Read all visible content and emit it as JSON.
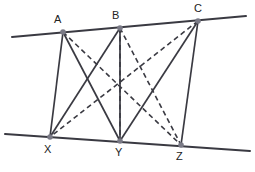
{
  "figure": {
    "background_color": "#ffffff",
    "solid_stroke_color": "#3a3a42",
    "dashed_stroke_color": "#3a3a42",
    "parallel_line_color": "#3a3a42",
    "vertex_fill_color": "#7a7a86",
    "label_color": "#222222",
    "solid_stroke_width": 1.7,
    "dashed_stroke_width": 1.6,
    "parallel_stroke_width": 2.0,
    "dash_pattern": "5,3.5",
    "vertex_radius": 2.8
  },
  "points": {
    "A": {
      "label": "A",
      "x": 63,
      "y": 32,
      "label_x": 54,
      "label_y": 23
    },
    "B": {
      "label": "B",
      "x": 120,
      "y": 28,
      "label_x": 112,
      "label_y": 19
    },
    "C": {
      "label": "C",
      "x": 198,
      "y": 21,
      "label_x": 194,
      "label_y": 12
    },
    "X": {
      "label": "X",
      "x": 50,
      "y": 137,
      "label_x": 44,
      "label_y": 153
    },
    "Y": {
      "label": "Y",
      "x": 120,
      "y": 141,
      "label_x": 115,
      "label_y": 156
    },
    "Z": {
      "label": "Z",
      "x": 181,
      "y": 145,
      "label_x": 176,
      "label_y": 160
    }
  },
  "parallel_lines": [
    {
      "name": "top-line",
      "x1": 12,
      "y1": 37,
      "x2": 246,
      "y2": 16
    },
    {
      "name": "bottom-line",
      "x1": 5,
      "y1": 134,
      "x2": 250,
      "y2": 151
    }
  ],
  "solid_segments": [
    {
      "name": "segment-AX",
      "from": "A",
      "to": "X",
      "x1": 63,
      "y1": 32,
      "x2": 50,
      "y2": 137
    },
    {
      "name": "segment-AY",
      "from": "A",
      "to": "Y",
      "x1": 63,
      "y1": 32,
      "x2": 120,
      "y2": 141
    },
    {
      "name": "segment-BX",
      "from": "B",
      "to": "X",
      "x1": 120,
      "y1": 28,
      "x2": 50,
      "y2": 137
    },
    {
      "name": "segment-BY",
      "from": "B",
      "to": "Y",
      "x1": 120,
      "y1": 28,
      "x2": 120,
      "y2": 141
    },
    {
      "name": "segment-CY",
      "from": "C",
      "to": "Y",
      "x1": 198,
      "y1": 21,
      "x2": 120,
      "y2": 141
    },
    {
      "name": "segment-CZ",
      "from": "C",
      "to": "Z",
      "x1": 198,
      "y1": 21,
      "x2": 181,
      "y2": 145
    }
  ],
  "dashed_segments": [
    {
      "name": "segment-AZ",
      "from": "A",
      "to": "Z",
      "x1": 63,
      "y1": 32,
      "x2": 181,
      "y2": 145
    },
    {
      "name": "segment-CX",
      "from": "C",
      "to": "X",
      "x1": 198,
      "y1": 21,
      "x2": 50,
      "y2": 137
    },
    {
      "name": "segment-BZ",
      "from": "B",
      "to": "Z",
      "x1": 120,
      "y1": 28,
      "x2": 181,
      "y2": 145
    },
    {
      "name": "segment-BY-dashed",
      "from": "B",
      "to": "Y",
      "x1": 120,
      "y1": 28,
      "x2": 120,
      "y2": 141
    }
  ]
}
